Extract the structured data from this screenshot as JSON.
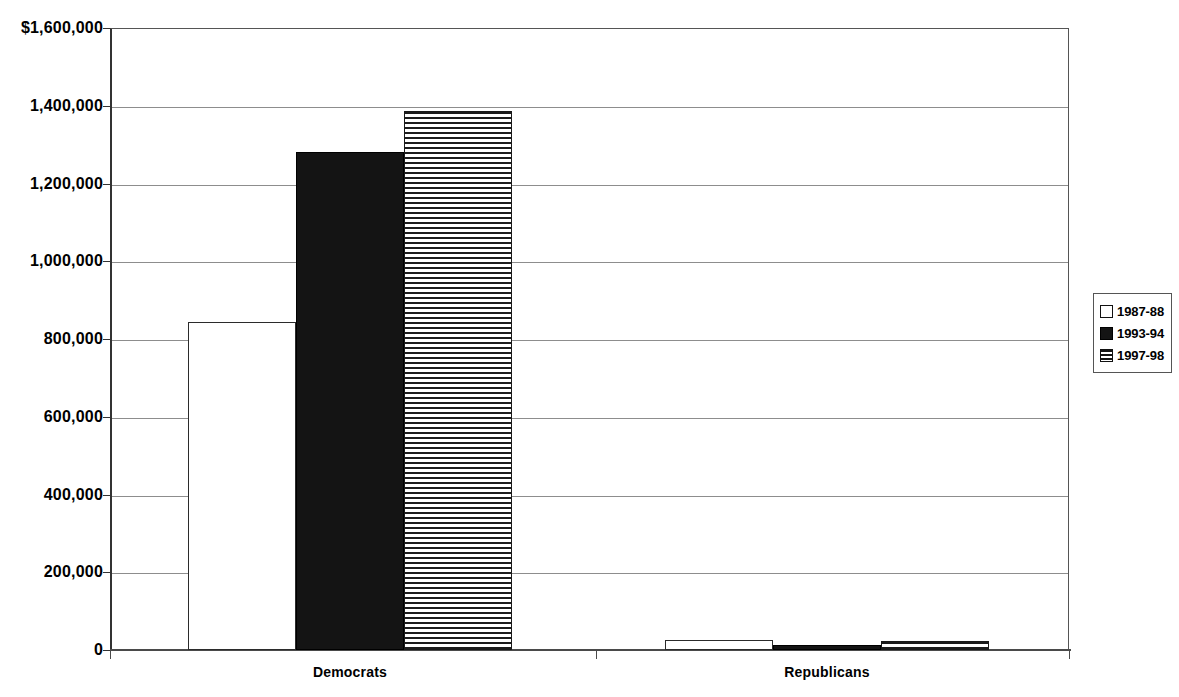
{
  "chart_data": {
    "type": "bar",
    "title": "",
    "subtitle": "",
    "xlabel": "",
    "ylabel": "",
    "categories": [
      "Democrats",
      "Republicans"
    ],
    "series": [
      {
        "name": "1987-88",
        "pattern": "white",
        "values": [
          843000,
          26000
        ]
      },
      {
        "name": "1993-94",
        "pattern": "black",
        "values": [
          1280000,
          13000
        ]
      },
      {
        "name": "1997-98",
        "pattern": "striped",
        "values": [
          1387000,
          23000
        ]
      }
    ],
    "ylim": [
      0,
      1600000
    ],
    "y_tick_values": [
      0,
      200000,
      400000,
      600000,
      800000,
      1000000,
      1200000,
      1400000,
      1600000
    ],
    "y_tick_labels": [
      "0",
      "200,000",
      "400,000",
      "600,000",
      "800,000",
      "1,000,000",
      "1,200,000",
      "1,400,000",
      "$1,600,000"
    ],
    "grid": true,
    "legend_position": "right",
    "legend_entries": [
      "1987-88",
      "1993-94",
      "1997-98"
    ],
    "colors": {
      "axis": "#333333",
      "grid": "#8d8d8d",
      "bar_outline": "#000000",
      "bar_fill_black": "#141414",
      "bar_fill_white": "#ffffff",
      "background": "#ffffff"
    }
  }
}
